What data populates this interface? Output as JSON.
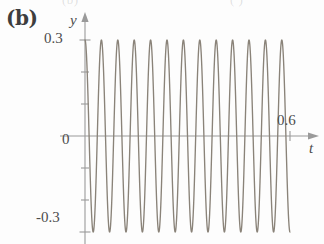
{
  "figure": {
    "panel_label": "(b)",
    "top_artifact_left": "(b)",
    "top_artifact_right": "(   )",
    "curve_color": "#8a8379",
    "axis_color": "#9a9a9a",
    "text_color": "#4c4c4c"
  },
  "axes": {
    "y_axis_label": "y",
    "x_axis_label": "t",
    "origin_label": "0",
    "y_ticks_labeled": [
      "0.3",
      "-0.3"
    ],
    "x_ticks_labeled": [
      "0.6"
    ]
  },
  "chart_data": {
    "type": "line",
    "title": "",
    "subtitle": "",
    "xlabel": "t",
    "ylabel": "y",
    "xlim": [
      0,
      0.66
    ],
    "ylim": [
      -0.36,
      0.36
    ],
    "grid": false,
    "legend": null,
    "x_ticks": [
      0,
      0.6
    ],
    "x_tick_labels": [
      "0",
      "0.6"
    ],
    "y_ticks": [
      -0.3,
      -0.2,
      -0.1,
      0,
      0.1,
      0.2,
      0.3
    ],
    "y_tick_labels": [
      "-0.3",
      "",
      "",
      "0",
      "",
      "",
      "0.3"
    ],
    "y_minor_ticks": [
      -0.2,
      -0.1,
      0.1,
      0.2
    ],
    "series": [
      {
        "name": "oscillation",
        "function": "y = 0.3*cos(2*pi*t/0.048)",
        "amplitude": 0.3,
        "period": 0.048,
        "cycles_shown": 12.5,
        "x_start": 0,
        "x_end": 0.6,
        "color": "#8a8379",
        "x": [
          0,
          0.012,
          0.024,
          0.036,
          0.048,
          0.06,
          0.072,
          0.084,
          0.096,
          0.108,
          0.12,
          0.132,
          0.144,
          0.156,
          0.168,
          0.18,
          0.192,
          0.204,
          0.216,
          0.228,
          0.24,
          0.252,
          0.264,
          0.276,
          0.288,
          0.3,
          0.312,
          0.324,
          0.336,
          0.348,
          0.36,
          0.372,
          0.384,
          0.396,
          0.408,
          0.42,
          0.432,
          0.444,
          0.456,
          0.468,
          0.48,
          0.492,
          0.504,
          0.516,
          0.528,
          0.54,
          0.552,
          0.564,
          0.576,
          0.588,
          0.6
        ],
        "values": [
          0.3,
          0,
          -0.3,
          0,
          0.3,
          0,
          -0.3,
          0,
          0.3,
          0,
          0.3,
          0,
          -0.3,
          0,
          0.3,
          0,
          -0.3,
          0,
          0.3,
          0,
          0.3,
          0,
          -0.3,
          0,
          0.3,
          0,
          -0.3,
          0,
          0.3,
          0,
          0.3,
          0,
          -0.3,
          0,
          0.3,
          0,
          -0.3,
          0,
          0.3,
          0,
          0.3,
          0,
          -0.3,
          0,
          0.3,
          0,
          -0.3,
          0,
          0.3,
          0,
          -0.3
        ]
      }
    ]
  }
}
